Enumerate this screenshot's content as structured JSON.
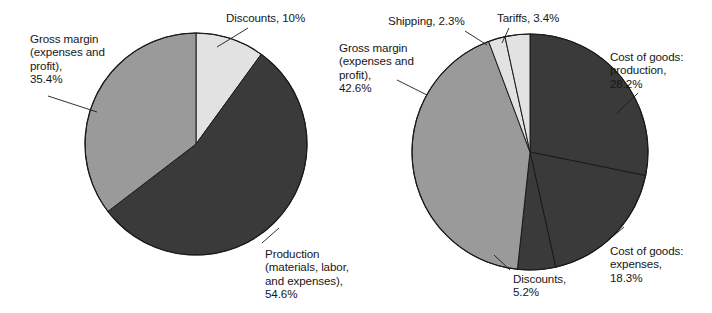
{
  "figure": {
    "background_color": "#ffffff",
    "width": 712,
    "height": 313,
    "palette": {
      "light": "#e2e2e2",
      "medium": "#9a9a9a",
      "dark": "#3a3a3a",
      "outline": "#1a1a1a",
      "text": "#171717"
    }
  },
  "chart_data": [
    {
      "type": "pie",
      "name": "left-pie-chart",
      "title": "",
      "start_angle_deg": 0,
      "direction": "clockwise",
      "center": [
        196,
        144
      ],
      "radius": 111,
      "categories": [
        "Discounts",
        "Production (materials, labor, and expenses)",
        "Gross margin (expenses and profit)"
      ],
      "values": [
        10.0,
        54.6,
        35.4
      ],
      "value_unit": "percent",
      "slice_colors": [
        "#e2e2e2",
        "#3a3a3a",
        "#9a9a9a"
      ],
      "labels": [
        {
          "id": "left-discounts",
          "lines": [
            "Discounts, 10%"
          ],
          "text": "Discounts, 10%",
          "value": "10%",
          "x": 226,
          "y": 11,
          "leader": {
            "x1": 248,
            "y1": 28,
            "x2": 217,
            "y2": 47
          }
        },
        {
          "id": "left-gross-margin",
          "lines": [
            "Gross margin",
            "(expenses and",
            "profit),",
            "35.4%"
          ],
          "text": "Gross margin (expenses and profit), 35.4%",
          "value": "35.4%",
          "x": 30,
          "y": 32,
          "leader": {
            "x1": 48,
            "y1": 96,
            "x2": 97,
            "y2": 112
          }
        },
        {
          "id": "left-production",
          "lines": [
            "Production",
            "(materials, labor,",
            "and expenses),",
            "54.6%"
          ],
          "text": "Production (materials, labor, and expenses), 54.6%",
          "value": "54.6%",
          "x": 265,
          "y": 247,
          "leader": {
            "x1": 262,
            "y1": 243,
            "x2": 279,
            "y2": 228
          }
        }
      ],
      "legend": "none",
      "grid": false
    },
    {
      "type": "pie",
      "name": "right-pie-chart",
      "title": "",
      "start_angle_deg": 0,
      "direction": "clockwise",
      "center": [
        530,
        152
      ],
      "radius": 118,
      "categories": [
        "Cost of goods: production",
        "Cost of goods: expenses",
        "Discounts",
        "Gross margin (expenses and profit)",
        "Shipping",
        "Tariffs"
      ],
      "values": [
        28.2,
        18.3,
        5.2,
        42.6,
        2.3,
        3.4
      ],
      "value_unit": "percent",
      "slice_colors": [
        "#3a3a3a",
        "#3a3a3a",
        "#3a3a3a",
        "#9a9a9a",
        "#e2e2e2",
        "#e2e2e2"
      ],
      "labels": [
        {
          "id": "right-shipping",
          "lines": [
            "Shipping, 2.3%"
          ],
          "text": "Shipping, 2.3%",
          "value": "2.3%",
          "x": 388,
          "y": 14,
          "leader": {
            "x1": 465,
            "y1": 31,
            "x2": 487,
            "y2": 45
          }
        },
        {
          "id": "right-tariffs",
          "lines": [
            "Tariffs, 3.4%"
          ],
          "text": "Tariffs, 3.4%",
          "value": "3.4%",
          "x": 497,
          "y": 11,
          "leader": {
            "x1": 509,
            "y1": 28,
            "x2": 502,
            "y2": 43
          }
        },
        {
          "id": "right-gross-margin",
          "lines": [
            "Gross margin",
            "(expenses and",
            "profit),",
            "42.6%"
          ],
          "text": "Gross margin (expenses and profit), 42.6%",
          "value": "42.6%",
          "x": 339,
          "y": 41,
          "leader": {
            "x1": 397,
            "y1": 80,
            "x2": 427,
            "y2": 95
          }
        },
        {
          "id": "right-cost-production",
          "lines": [
            "Cost of goods:",
            "production,",
            "28.2%"
          ],
          "text": "Cost of goods: production, 28.2%",
          "value": "28.2%",
          "x": 610,
          "y": 50,
          "leader": {
            "x1": 638,
            "y1": 93,
            "x2": 617,
            "y2": 113
          }
        },
        {
          "id": "right-cost-expenses",
          "lines": [
            "Cost of goods:",
            "expenses,",
            "18.3%"
          ],
          "text": "Cost of goods: expenses, 18.3%",
          "value": "18.3%",
          "x": 610,
          "y": 244,
          "leader": {
            "x1": 606,
            "y1": 242,
            "x2": 624,
            "y2": 227
          }
        },
        {
          "id": "right-discounts",
          "lines": [
            "Discounts,",
            "5.2%"
          ],
          "text": "Discounts, 5.2%",
          "value": "5.2%",
          "x": 513,
          "y": 272,
          "leader": {
            "x1": 510,
            "y1": 270,
            "x2": 494,
            "y2": 255
          }
        }
      ],
      "legend": "none",
      "grid": false
    }
  ]
}
